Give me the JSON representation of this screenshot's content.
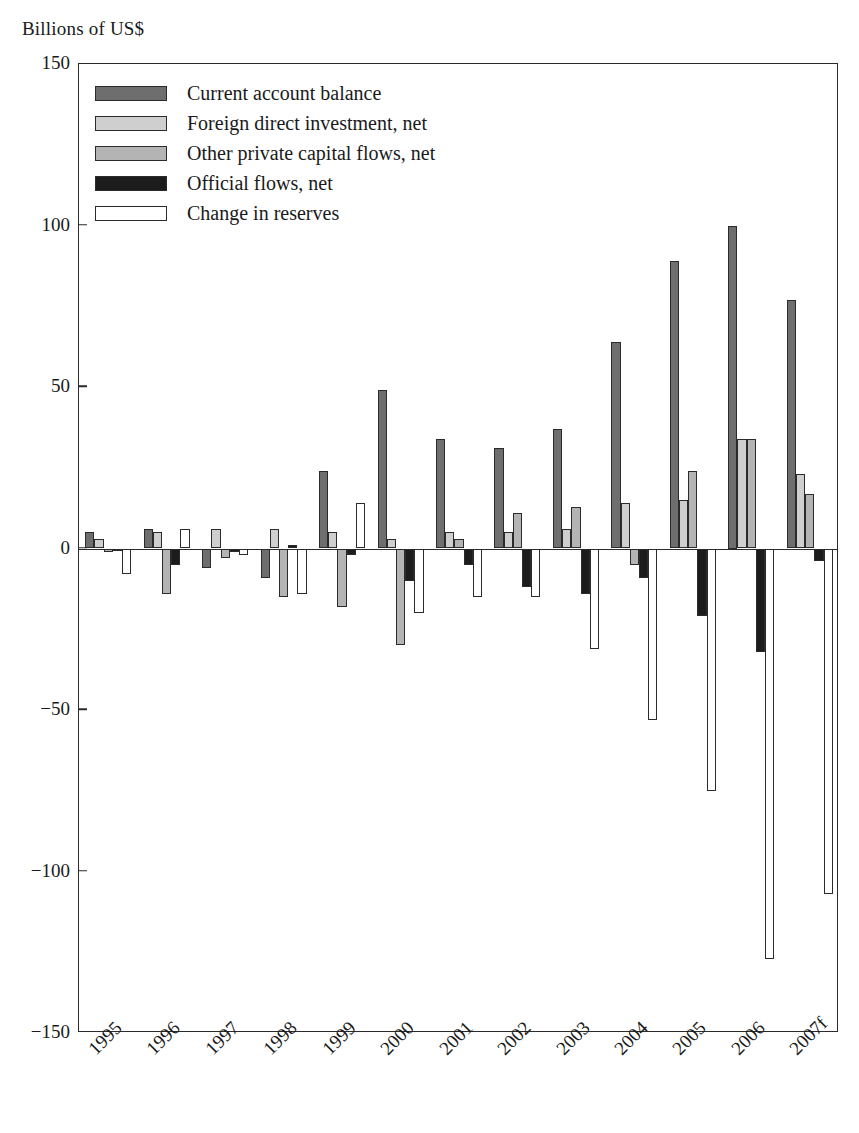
{
  "axis_title": "Billions of US$",
  "legend": [
    {
      "label": "Current account balance",
      "key": "current_account_balance",
      "swatch": "s0"
    },
    {
      "label": "Foreign direct investment, net",
      "key": "fdi_net",
      "swatch": "s1"
    },
    {
      "label": "Other private capital flows, net",
      "key": "other_private_capital_net",
      "swatch": "s2"
    },
    {
      "label": "Official flows, net",
      "key": "official_flows_net",
      "swatch": "s3"
    },
    {
      "label": "Change in reserves",
      "key": "change_in_reserves",
      "swatch": "s4"
    }
  ],
  "colors": {
    "current_account_balance": "#6e6e6e",
    "fdi_net": "#cfcfcf",
    "other_private_capital_net": "#b4b4b4",
    "official_flows_net": "#1c1c1c",
    "change_in_reserves": "#ffffff",
    "axis": "#2b2b2b"
  },
  "chart_data": {
    "type": "bar",
    "title": "",
    "subtitle": "",
    "xlabel": "",
    "ylabel": "Billions of US$",
    "ylim": [
      -150,
      150
    ],
    "yticks": [
      150,
      100,
      50,
      0,
      -50,
      -100,
      -150
    ],
    "ytick_labels": [
      "150",
      "100",
      "50",
      "0",
      "−50",
      "−100",
      "−150"
    ],
    "grid": false,
    "legend_position": "top-left",
    "categories": [
      "1995",
      "1996",
      "1997",
      "1998",
      "1999",
      "2000",
      "2001",
      "2002",
      "2003",
      "2004",
      "2005",
      "2006",
      "2007f"
    ],
    "series": [
      {
        "name": "Current account balance",
        "values": [
          5,
          6,
          -6,
          -9,
          24,
          49,
          34,
          31,
          37,
          64,
          89,
          100,
          77
        ]
      },
      {
        "name": "Foreign direct investment, net",
        "values": [
          3,
          5,
          6,
          6,
          5,
          3,
          5,
          5,
          6,
          14,
          15,
          34,
          23
        ]
      },
      {
        "name": "Other private capital flows, net",
        "values": [
          -1,
          -14,
          -3,
          -15,
          -18,
          -30,
          3,
          11,
          13,
          -5,
          24,
          34,
          17
        ]
      },
      {
        "name": "Official flows, net",
        "values": [
          0,
          -5,
          -1,
          1,
          -2,
          -10,
          -5,
          -12,
          -14,
          -9,
          -21,
          -32,
          -4
        ]
      },
      {
        "name": "Change in reserves",
        "values": [
          -8,
          6,
          -2,
          -14,
          14,
          -20,
          -15,
          -15,
          -31,
          -53,
          -75,
          -127,
          -107
        ]
      }
    ]
  }
}
